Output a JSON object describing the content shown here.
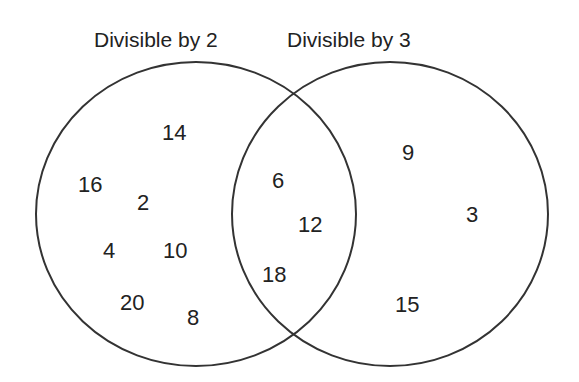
{
  "title_left": "Divisible by 2",
  "title_right": "Divisible by 3",
  "left_only": [
    {
      "v": "14",
      "x": 162,
      "y": 120
    },
    {
      "v": "16",
      "x": 78,
      "y": 172
    },
    {
      "v": "2",
      "x": 137,
      "y": 190
    },
    {
      "v": "4",
      "x": 103,
      "y": 238
    },
    {
      "v": "10",
      "x": 163,
      "y": 238
    },
    {
      "v": "20",
      "x": 120,
      "y": 290
    },
    {
      "v": "8",
      "x": 187,
      "y": 305
    }
  ],
  "both": [
    {
      "v": "6",
      "x": 272,
      "y": 168
    },
    {
      "v": "12",
      "x": 298,
      "y": 212
    },
    {
      "v": "18",
      "x": 262,
      "y": 262
    }
  ],
  "right_only": [
    {
      "v": "9",
      "x": 402,
      "y": 140
    },
    {
      "v": "3",
      "x": 466,
      "y": 202
    },
    {
      "v": "15",
      "x": 395,
      "y": 292
    }
  ]
}
